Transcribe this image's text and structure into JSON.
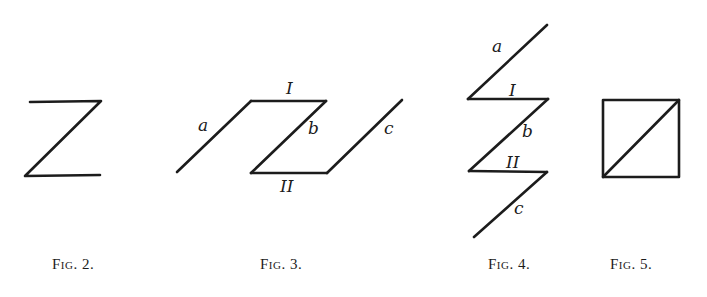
{
  "colors": {
    "ink": "#1c1c1c",
    "paper": "#ffffff"
  },
  "figures": [
    {
      "id": "fig2",
      "caption": "Fig. 2.",
      "shape": "Z-shape: top horizontal, diagonal, bottom horizontal",
      "labels": []
    },
    {
      "id": "fig3",
      "caption": "Fig. 3.",
      "shape": "parallelogram-like path with extension lines a and c",
      "labels": {
        "a": "a",
        "I": "I",
        "b": "b",
        "c": "c",
        "II": "II"
      }
    },
    {
      "id": "fig4",
      "caption": "Fig. 4.",
      "shape": "zigzag path: a, I, b, II, c",
      "labels": {
        "a": "a",
        "I": "I",
        "b": "b",
        "II": "II",
        "c": "c"
      }
    },
    {
      "id": "fig5",
      "caption": "Fig. 5.",
      "shape": "square with diagonal from bottom-left to top-right",
      "labels": []
    }
  ]
}
